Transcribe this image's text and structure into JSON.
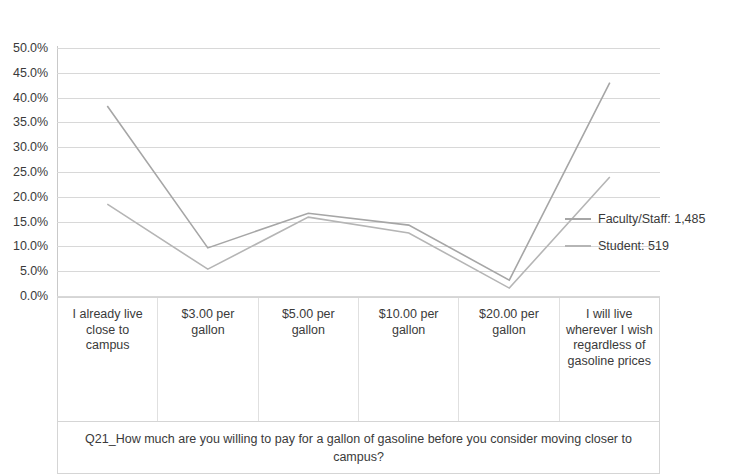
{
  "chart_data": {
    "type": "line",
    "title": "",
    "xlabel": "Q21_How much are you willing to pay for a gallon of gasoline before you consider moving closer to campus?",
    "ylabel": "",
    "ylim": [
      0,
      50
    ],
    "ytick_step": 5,
    "grid": true,
    "legend_position": "right",
    "categories": [
      "I already live close to campus",
      "$3.00 per gallon",
      "$5.00 per gallon",
      "$10.00 per gallon",
      "$20.00 per gallon",
      "I will live wherever I wish regardless of gasoline prices"
    ],
    "ytick_labels": [
      "50.0%",
      "45.0%",
      "40.0%",
      "35.0%",
      "30.0%",
      "25.0%",
      "20.0%",
      "15.0%",
      "10.0%",
      "5.0%",
      "0.0%"
    ],
    "ytick_values": [
      50,
      45,
      40,
      35,
      30,
      25,
      20,
      15,
      10,
      5,
      0
    ],
    "series": [
      {
        "name": "Faculty/Staff: 1,485",
        "color": "#a6a6a6",
        "values": [
          38.3,
          9.7,
          16.7,
          14.3,
          3.2,
          43.0
        ]
      },
      {
        "name": "Student: 519",
        "color": "#b5b5b5",
        "values": [
          18.5,
          5.4,
          15.9,
          12.7,
          1.6,
          24.0
        ]
      }
    ]
  },
  "legend": {
    "items": [
      {
        "label": "Faculty/Staff: 1,485",
        "color": "#a6a6a6"
      },
      {
        "label": "Student: 519",
        "color": "#b5b5b5"
      }
    ]
  }
}
